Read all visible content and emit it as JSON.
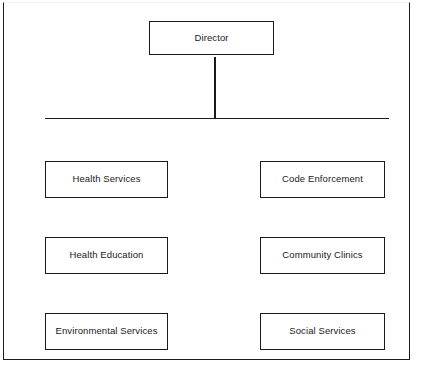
{
  "diagram": {
    "type": "organization-chart",
    "root": {
      "label": "Director"
    },
    "connectors": {
      "vertical_stem": "vertical-connector",
      "horizontal_bus": "horizontal-connector"
    },
    "columns": {
      "left": [
        {
          "label": "Health Services"
        },
        {
          "label": "Health Education"
        },
        {
          "label": "Environmental Services"
        }
      ],
      "right": [
        {
          "label": "Code Enforcement"
        },
        {
          "label": "Community Clinics"
        },
        {
          "label": "Social Services"
        }
      ]
    },
    "colors": {
      "border": "#1a1a1a",
      "fill": "#ffffff",
      "text": "#1a1a1a",
      "frame_top": "#f2f2f2"
    }
  }
}
